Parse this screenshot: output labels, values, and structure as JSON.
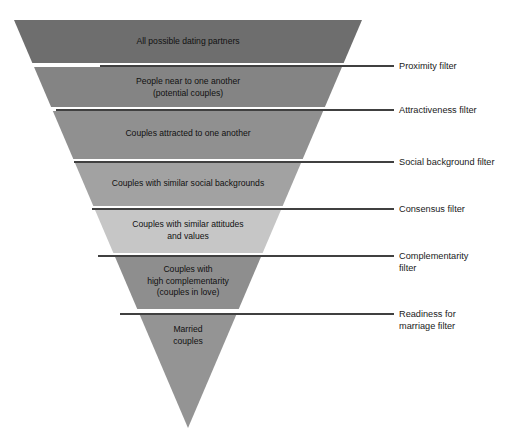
{
  "figure": {
    "type": "funnel-diagram",
    "background_color": "#ffffff",
    "apex": {
      "x": 188,
      "y": 428
    },
    "top_left_x": 14,
    "top_right_x": 362,
    "top_y": 20
  },
  "funnel": {
    "bands": [
      {
        "id": "all-possible-dating-partners",
        "lines": [
          "All possible dating partners"
        ],
        "color": "#6e6e6e",
        "top": 20,
        "bottom": 63,
        "text_y": 44
      },
      {
        "id": "people-near-to-one-another",
        "lines": [
          "People near to one another",
          "(potential couples)"
        ],
        "color": "#848484",
        "top": 67,
        "bottom": 107,
        "text_y": 84
      },
      {
        "id": "couples-attracted-to-one-another",
        "lines": [
          "Couples attracted to one another"
        ],
        "color": "#909090",
        "top": 111,
        "bottom": 159,
        "text_y": 136
      },
      {
        "id": "couples-with-similar-social-backgrounds",
        "lines": [
          "Couples with similar social backgrounds"
        ],
        "color": "#a2a2a2",
        "top": 163,
        "bottom": 206,
        "text_y": 186
      },
      {
        "id": "couples-with-similar-attitudes-and-values",
        "lines": [
          "Couples with similar attitudes",
          "and values"
        ],
        "color": "#c6c6c6",
        "top": 210,
        "bottom": 253,
        "text_y": 227
      },
      {
        "id": "couples-with-high-complementarity",
        "lines": [
          "Couples with",
          "high complementarity",
          "(couples in love)"
        ],
        "color": "#8e8e8e",
        "top": 257,
        "bottom": 309,
        "text_y": 272
      },
      {
        "id": "married-couples",
        "lines": [
          "Married",
          "couples"
        ],
        "color": "#949494",
        "top": 315,
        "bottom": 428,
        "text_y": 332
      }
    ]
  },
  "filters": [
    {
      "id": "proximity-filter",
      "lines": [
        "Proximity filter"
      ],
      "line_y": 66,
      "line_x1": 100,
      "line_x2": 394,
      "text_x": 399,
      "text_y": 69
    },
    {
      "id": "attractiveness-filter",
      "lines": [
        "Attractiveness filter"
      ],
      "line_y": 110,
      "line_x1": 56,
      "line_x2": 394,
      "text_x": 399,
      "text_y": 113
    },
    {
      "id": "social-background-filter",
      "lines": [
        "Social background filter"
      ],
      "line_y": 162,
      "line_x1": 74,
      "line_x2": 394,
      "text_x": 399,
      "text_y": 165
    },
    {
      "id": "consensus-filter",
      "lines": [
        "Consensus filter"
      ],
      "line_y": 209,
      "line_x1": 92,
      "line_x2": 394,
      "text_x": 399,
      "text_y": 212
    },
    {
      "id": "complementarity-filter",
      "lines": [
        "Complementarity",
        "filter"
      ],
      "line_y": 256,
      "line_x1": 98,
      "line_x2": 394,
      "text_x": 399,
      "text_y": 259
    },
    {
      "id": "readiness-for-marriage-filter",
      "lines": [
        "Readiness for",
        "marriage filter"
      ],
      "line_y": 314,
      "line_x1": 120,
      "line_x2": 394,
      "text_x": 399,
      "text_y": 317
    }
  ],
  "colors": {
    "band_darkest": "#6e6e6e",
    "band_lightest": "#c6c6c6",
    "leader_line": "#000000",
    "text": "#111111",
    "background": "#ffffff"
  }
}
